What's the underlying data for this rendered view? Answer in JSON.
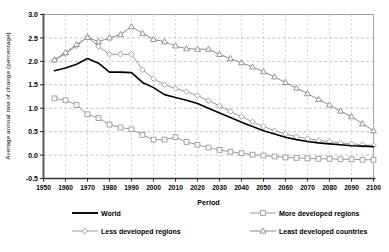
{
  "chart_data": {
    "type": "line",
    "title": "",
    "xlabel": "Period",
    "ylabel": "Average annual rate of change (percentage)",
    "xlim": [
      1950,
      2100
    ],
    "ylim": [
      -0.5,
      3.0
    ],
    "grid": true,
    "legend_position": "bottom",
    "xticks": [
      "1950",
      "1960",
      "1970",
      "1980",
      "1990",
      "2000",
      "2010",
      "2020",
      "2030",
      "2040",
      "2050",
      "2060",
      "2070",
      "2080",
      "2090",
      "2100"
    ],
    "yticks": [
      "-0.5",
      "0.0",
      "0.5",
      "1.0",
      "1.5",
      "2.0",
      "2.5",
      "3.0"
    ],
    "x": [
      1955,
      1960,
      1965,
      1970,
      1975,
      1980,
      1985,
      1990,
      1995,
      2000,
      2005,
      2010,
      2015,
      2020,
      2025,
      2030,
      2035,
      2040,
      2045,
      2050,
      2055,
      2060,
      2065,
      2070,
      2075,
      2080,
      2085,
      2090,
      2095,
      2100
    ],
    "series": [
      {
        "name": "World",
        "marker": "none",
        "color": "#000000",
        "values": [
          1.8,
          1.86,
          1.94,
          2.06,
          1.96,
          1.77,
          1.77,
          1.76,
          1.55,
          1.44,
          1.29,
          1.23,
          1.17,
          1.1,
          1.0,
          0.9,
          0.8,
          0.7,
          0.61,
          0.52,
          0.45,
          0.38,
          0.33,
          0.29,
          0.26,
          0.24,
          0.22,
          0.2,
          0.19,
          0.18
        ]
      },
      {
        "name": "More developed regions",
        "marker": "square",
        "color": "#9a9a9a",
        "values": [
          1.21,
          1.17,
          1.07,
          0.87,
          0.79,
          0.65,
          0.59,
          0.55,
          0.43,
          0.33,
          0.33,
          0.38,
          0.28,
          0.22,
          0.16,
          0.11,
          0.07,
          0.04,
          0.01,
          -0.01,
          -0.03,
          -0.05,
          -0.06,
          -0.07,
          -0.08,
          -0.08,
          -0.09,
          -0.09,
          -0.1,
          -0.1
        ]
      },
      {
        "name": "Less developed regions",
        "marker": "diamond",
        "color": "#9a9a9a",
        "values": [
          2.03,
          2.16,
          2.33,
          2.52,
          2.32,
          2.15,
          2.15,
          2.15,
          1.82,
          1.63,
          1.5,
          1.42,
          1.35,
          1.27,
          1.16,
          1.05,
          0.93,
          0.82,
          0.71,
          0.61,
          0.52,
          0.45,
          0.39,
          0.35,
          0.31,
          0.29,
          0.26,
          0.24,
          0.22,
          0.2
        ]
      },
      {
        "name": "Least developed countries",
        "marker": "triangle",
        "color": "#8a8a8a",
        "values": [
          2.03,
          2.19,
          2.36,
          2.51,
          2.42,
          2.5,
          2.57,
          2.74,
          2.6,
          2.47,
          2.42,
          2.33,
          2.27,
          2.26,
          2.26,
          2.15,
          2.06,
          1.97,
          1.88,
          1.78,
          1.67,
          1.55,
          1.43,
          1.31,
          1.19,
          1.07,
          0.94,
          0.82,
          0.67,
          0.52
        ]
      }
    ]
  },
  "legend": {
    "items": [
      {
        "label": "World",
        "marker": "none"
      },
      {
        "label": "More developed regions",
        "marker": "square"
      },
      {
        "label": "Less developed regions",
        "marker": "diamond"
      },
      {
        "label": "Least developed countries",
        "marker": "triangle"
      }
    ]
  }
}
